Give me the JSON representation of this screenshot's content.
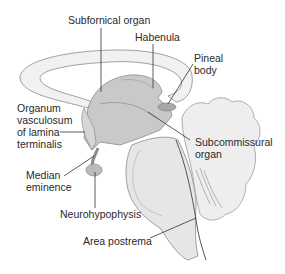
{
  "diagram": {
    "labels": {
      "subfornical_organ": "Subfornical organ",
      "habenula": "Habenula",
      "pineal_body_1": "Pineal",
      "pineal_body_2": "body",
      "ovlt_1": "Organum",
      "ovlt_2": "vasculosum",
      "ovlt_3": "of lamina",
      "ovlt_4": "terminalis",
      "subcommissural_1": "Subcommissural",
      "subcommissural_2": "organ",
      "median_eminence_1": "Median",
      "median_eminence_2": "eminence",
      "neurohypophysis": "Neurohypophysis",
      "area_postrema": "Area postrema"
    },
    "colors": {
      "background": "#ffffff",
      "outline": "#8a8a8a",
      "ventricle_fill": "#c9c9c9",
      "tissue_fill": "#e6e6e6",
      "leader_line": "#333333",
      "text": "#2a2a2a"
    }
  }
}
